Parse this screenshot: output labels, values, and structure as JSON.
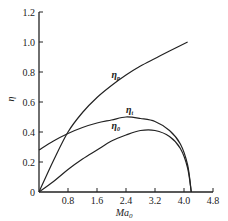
{
  "chart_data": {
    "type": "line",
    "title": "",
    "xlabel": "Ma₀",
    "ylabel": "η",
    "xlim": [
      0,
      4.8
    ],
    "ylim": [
      0,
      1.2
    ],
    "grid": false,
    "legend": "inline labels on curves",
    "x_ticks": [
      "0",
      "0.8",
      "1.6",
      "2.4",
      "3.2",
      "4.0",
      "4.8"
    ],
    "y_ticks": [
      "0",
      "0.2",
      "0.4",
      "0.6",
      "0.8",
      "1.0",
      "1.2"
    ],
    "series": [
      {
        "name": "η_p",
        "x": [
          0,
          0.4,
          0.8,
          1.2,
          1.6,
          2.0,
          2.4,
          2.8,
          3.2,
          3.6,
          4.1
        ],
        "y": [
          0,
          0.21,
          0.4,
          0.53,
          0.63,
          0.71,
          0.78,
          0.84,
          0.89,
          0.94,
          1.0
        ]
      },
      {
        "name": "η_t",
        "x": [
          0,
          0.4,
          0.8,
          1.2,
          1.6,
          2.0,
          2.4,
          2.8,
          3.2,
          3.6,
          3.9,
          4.1,
          4.2
        ],
        "y": [
          0.28,
          0.34,
          0.39,
          0.43,
          0.46,
          0.48,
          0.5,
          0.49,
          0.47,
          0.41,
          0.32,
          0.18,
          0
        ]
      },
      {
        "name": "η_0",
        "x": [
          0,
          0.4,
          0.8,
          1.2,
          1.6,
          2.0,
          2.4,
          2.8,
          3.2,
          3.6,
          3.9,
          4.1,
          4.2
        ],
        "y": [
          0,
          0.07,
          0.15,
          0.22,
          0.28,
          0.34,
          0.38,
          0.41,
          0.41,
          0.37,
          0.29,
          0.16,
          0
        ]
      }
    ],
    "annotations": [
      {
        "text": "η_p",
        "x": 2.0,
        "y": 0.76
      },
      {
        "text": "η_t",
        "x": 2.4,
        "y": 0.53
      },
      {
        "text": "η_0",
        "x": 2.0,
        "y": 0.42
      }
    ]
  },
  "labels": {
    "eta_p": "η",
    "eta_p_sub": "p",
    "eta_t": "η",
    "eta_t_sub": "t",
    "eta_0": "η",
    "eta_0_sub": "0",
    "xlabel_main": "Ma",
    "xlabel_sub": "0",
    "ylabel": "η"
  }
}
